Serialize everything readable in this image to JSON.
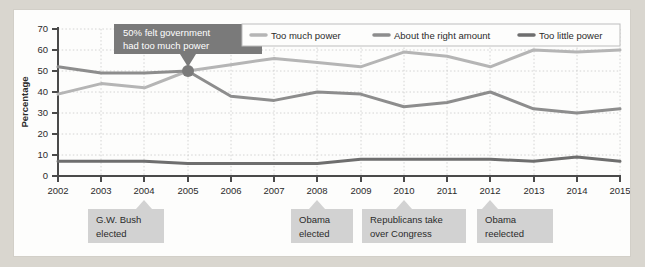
{
  "chart_data": {
    "type": "line",
    "title": "",
    "xlabel": "",
    "ylabel": "Percentage",
    "ylim": [
      0,
      70
    ],
    "ytick_step": 10,
    "grid": true,
    "legend_position": "top-right",
    "x": [
      2002,
      2003,
      2004,
      2005,
      2006,
      2007,
      2008,
      2009,
      2010,
      2011,
      2012,
      2013,
      2014,
      2015
    ],
    "categories": [
      "2002",
      "2003",
      "2004",
      "2005",
      "2006",
      "2007",
      "2008",
      "2009",
      "2010",
      "2011",
      "2012",
      "2013",
      "2014",
      "2015"
    ],
    "yticks": [
      "0",
      "10",
      "20",
      "30",
      "40",
      "50",
      "60",
      "70"
    ],
    "series": [
      {
        "name": "Too much power",
        "color": "#b5b5b5",
        "values": [
          39,
          44,
          42,
          50,
          53,
          56,
          54,
          52,
          59,
          57,
          52,
          60,
          59,
          60
        ]
      },
      {
        "name": "About the right amount",
        "color": "#8d8d8d",
        "values": [
          52,
          49,
          49,
          50,
          38,
          36,
          40,
          39,
          33,
          35,
          40,
          32,
          30,
          32
        ]
      },
      {
        "name": "Too little power",
        "color": "#6e6e6e",
        "values": [
          7,
          7,
          7,
          6,
          6,
          6,
          6,
          8,
          8,
          8,
          8,
          7,
          9,
          7
        ]
      }
    ],
    "annotations": [
      {
        "id": "callout-too-much-power",
        "text_line1": "50% felt government",
        "text_line2": "had too much power",
        "marker_x": 2005,
        "marker_y": 50,
        "style": "dark-callout"
      },
      {
        "id": "event-bush-elected",
        "text_line1": "G.W. Bush",
        "text_line2": "elected",
        "x": 2004,
        "style": "axis-note"
      },
      {
        "id": "event-obama-elected",
        "text_line1": "Obama",
        "text_line2": "elected",
        "x": 2008,
        "style": "axis-note"
      },
      {
        "id": "event-republicans-congress",
        "text_line1": "Republicans take",
        "text_line2": "over Congress",
        "x": 2010,
        "style": "axis-note"
      },
      {
        "id": "event-obama-reelected",
        "text_line1": "Obama",
        "text_line2": "reelected",
        "x": 2012,
        "style": "axis-note"
      }
    ]
  },
  "colors": {
    "page_background": "#d9d6cf",
    "plot_background": "#fdfdfc",
    "axis": "#4a4a4a",
    "grid": "#c9c9c9",
    "callout_fill": "#7a7a7a",
    "callout_text": "#ffffff",
    "note_fill": "#d2d2d2",
    "note_text": "#2b2b2b",
    "legend_border": "#bdbdbd"
  }
}
